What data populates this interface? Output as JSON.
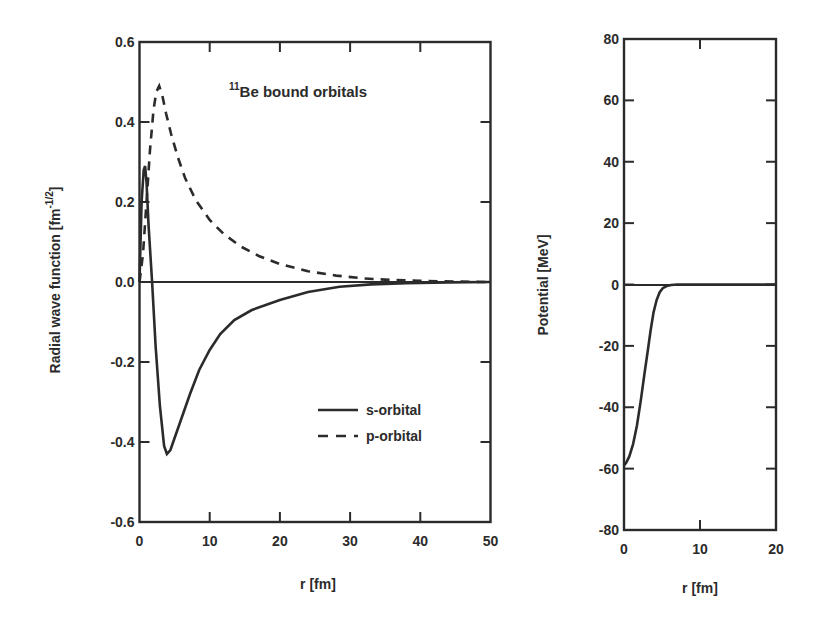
{
  "chart_data": [
    {
      "id": "wavefunctions",
      "type": "line",
      "title": "",
      "annotation": {
        "superscript": "11",
        "text": "Be bound orbitals"
      },
      "xlabel": "r [fm]",
      "ylabel": "Radial wave function [fm",
      "ylabel_exponent": "-1/2",
      "ylabel_close": "]",
      "xlim": [
        0,
        50
      ],
      "ylim": [
        -0.6,
        0.6
      ],
      "xticks": [
        0,
        10,
        20,
        30,
        40,
        50
      ],
      "xtick_labels": [
        "0",
        "10",
        "20",
        "30",
        "40",
        "50"
      ],
      "yticks": [
        -0.6,
        -0.4,
        -0.2,
        0.0,
        0.2,
        0.4,
        0.6
      ],
      "ytick_labels": [
        "-0.6",
        "-0.4",
        "-0.2",
        "0.0",
        "0.2",
        "0.4",
        "0.6"
      ],
      "grid": false,
      "zero_line": true,
      "legend_position": "lower right",
      "series": [
        {
          "name": "s-orbital",
          "style": "solid",
          "x": [
            0,
            0.3,
            0.6,
            0.8,
            1.0,
            1.3,
            1.8,
            2.3,
            2.9,
            3.5,
            3.9,
            4.4,
            5.2,
            6.2,
            7.2,
            8.5,
            10.0,
            11.5,
            13.5,
            16.0,
            20.0,
            24.0,
            28.5,
            33.0,
            38.0,
            44.0,
            50.0
          ],
          "y": [
            0.0,
            0.2,
            0.28,
            0.29,
            0.25,
            0.14,
            0.0,
            -0.16,
            -0.31,
            -0.41,
            -0.43,
            -0.42,
            -0.38,
            -0.33,
            -0.28,
            -0.22,
            -0.17,
            -0.13,
            -0.095,
            -0.07,
            -0.045,
            -0.025,
            -0.012,
            -0.006,
            -0.003,
            -0.001,
            0.0
          ]
        },
        {
          "name": "p-orbital",
          "style": "dashed",
          "x": [
            0,
            0.5,
            1.0,
            1.5,
            2.0,
            2.4,
            2.8,
            3.2,
            3.8,
            4.5,
            5.5,
            6.5,
            8.0,
            10.0,
            12.0,
            14.5,
            17.0,
            20.0,
            24.0,
            28.0,
            32.0,
            36.0,
            40.0,
            45.0,
            50.0
          ],
          "y": [
            0.0,
            0.07,
            0.2,
            0.33,
            0.43,
            0.475,
            0.49,
            0.47,
            0.42,
            0.37,
            0.31,
            0.26,
            0.205,
            0.155,
            0.12,
            0.088,
            0.065,
            0.045,
            0.027,
            0.016,
            0.009,
            0.005,
            0.003,
            0.001,
            0.0
          ]
        }
      ]
    },
    {
      "id": "potential",
      "type": "line",
      "title": "",
      "xlabel": "r [fm]",
      "ylabel": "Potential [MeV]",
      "xlim": [
        0,
        20
      ],
      "ylim": [
        -80,
        80
      ],
      "xticks": [
        0,
        10,
        20
      ],
      "xtick_labels": [
        "0",
        "10",
        "20"
      ],
      "yticks": [
        -80,
        -60,
        -40,
        -20,
        0,
        20,
        40,
        60,
        80
      ],
      "ytick_labels": [
        "-80",
        "-60",
        "-40",
        "-20",
        "0",
        "20",
        "40",
        "60",
        "80"
      ],
      "grid": false,
      "zero_line": true,
      "series": [
        {
          "name": "Potential",
          "style": "solid",
          "x": [
            0,
            0.3,
            0.7,
            1.2,
            1.7,
            2.2,
            2.7,
            3.1,
            3.5,
            3.9,
            4.3,
            4.7,
            5.1,
            5.6,
            6.2,
            7.0,
            10.0,
            20.0
          ],
          "y": [
            -59,
            -58,
            -56,
            -52,
            -46,
            -38,
            -29,
            -22,
            -15,
            -9,
            -5,
            -2.5,
            -1.2,
            -0.5,
            -0.15,
            0.0,
            0.0,
            0.0
          ]
        }
      ]
    }
  ]
}
